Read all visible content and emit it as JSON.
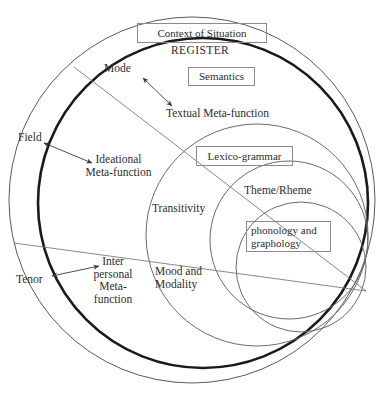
{
  "diagram": {
    "style": {
      "thin_stroke": "#5a5a5a",
      "thick_stroke": "#1a1a1a",
      "box_border": "#8b8b8b",
      "text_color": "#2d2d2d",
      "background": "#ffffff"
    },
    "boxed_labels": [
      {
        "id": "context-of-situation",
        "text": "Context of Situation",
        "x": 137,
        "y": 23,
        "w": 128,
        "h": 18
      },
      {
        "id": "semantics",
        "text": "Semantics",
        "x": 188,
        "y": 67,
        "w": 65,
        "h": 17
      },
      {
        "id": "lexico-grammar",
        "text": "Lexico-grammar",
        "x": 196,
        "y": 146,
        "w": 95,
        "h": 18
      },
      {
        "id": "phonology-and-graphology",
        "text": "phonology and\ngraphology",
        "x": 246,
        "y": 221,
        "w": 85,
        "h": 31
      }
    ],
    "plain_labels": [
      {
        "id": "register",
        "text": "REGISTER",
        "x": 171,
        "y": 44,
        "size": 11.5,
        "letter_spacing": 0.4
      },
      {
        "id": "mode",
        "text": "Mode",
        "x": 104,
        "y": 62,
        "size": 11.5
      },
      {
        "id": "field",
        "text": "Field",
        "x": 18,
        "y": 131,
        "size": 11.5
      },
      {
        "id": "tenor",
        "text": "Tenor",
        "x": 16,
        "y": 273,
        "size": 11.5
      },
      {
        "id": "textual-meta-function",
        "text": "Textual Meta-function",
        "x": 166,
        "y": 107,
        "size": 11.5
      },
      {
        "id": "ideational-meta-function",
        "text": "Ideational\nMeta-function",
        "x": 96,
        "y": 153,
        "size": 11.5
      },
      {
        "id": "interpersonal-meta-function",
        "text": "Inter\npersonal\nMeta-\nfunction",
        "x": 89,
        "y": 255,
        "size": 11.5
      },
      {
        "id": "transitivity",
        "text": "Transitivity",
        "x": 152,
        "y": 202,
        "size": 11.5
      },
      {
        "id": "theme-rheme",
        "text": "Theme/Rheme",
        "x": 244,
        "y": 184,
        "size": 11.5
      },
      {
        "id": "mood-and-modality",
        "text": "Mood and\nModality",
        "x": 155,
        "y": 265,
        "size": 11.5
      }
    ],
    "circles": [
      {
        "id": "outer-context-circle",
        "label": "Context of Situation",
        "cx": 192,
        "cy": 200,
        "r": 183,
        "stroke_width": 1.0,
        "weight": "thin"
      },
      {
        "id": "semantics-circle",
        "label": "Semantics",
        "cx": 203,
        "cy": 203,
        "r": 165,
        "stroke_width": 2.6,
        "weight": "thick"
      },
      {
        "id": "lexico-grammar-circle",
        "label": "Lexico-grammar",
        "cx": 257,
        "cy": 235,
        "r": 111,
        "stroke_width": 1.0,
        "weight": "thin"
      },
      {
        "id": "theme-rheme-circle",
        "label": "Theme/Rheme ring",
        "cx": 289,
        "cy": 240,
        "r": 79,
        "stroke_width": 1.0,
        "weight": "thin"
      },
      {
        "id": "phonology-circle",
        "label": "phonology and graphology",
        "cx": 301,
        "cy": 267,
        "r": 65,
        "stroke_width": 1.0,
        "weight": "thin"
      }
    ],
    "radial_lines": [
      {
        "id": "mode-radial",
        "x1": 74,
        "y1": 67,
        "x2": 366,
        "y2": 291
      },
      {
        "id": "tenor-radial",
        "x1": 14,
        "y1": 243,
        "x2": 366,
        "y2": 291
      }
    ],
    "arrows": [
      {
        "id": "mode-arrow",
        "label": "Mode",
        "x1": 143,
        "y1": 78,
        "x2": 172,
        "y2": 106
      },
      {
        "id": "field-arrow",
        "label": "Field",
        "x1": 44,
        "y1": 143,
        "x2": 92,
        "y2": 163
      },
      {
        "id": "tenor-arrow",
        "label": "Tenor",
        "x1": 52,
        "y1": 276,
        "x2": 99,
        "y2": 266
      }
    ]
  }
}
